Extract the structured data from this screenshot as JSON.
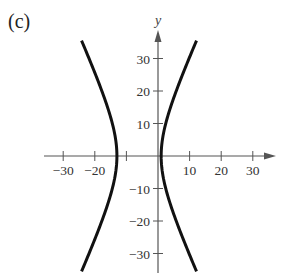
{
  "panel_label": "(c)",
  "chart_data": {
    "type": "line",
    "title": "",
    "xlabel": "x",
    "ylabel": "y",
    "xlim": [
      -35,
      38
    ],
    "ylim": [
      -36,
      40
    ],
    "grid": false,
    "legend": null,
    "x_ticks": [
      -30,
      -20,
      -10,
      10,
      20,
      30
    ],
    "x_tick_labels": [
      "−30",
      "−20",
      "10",
      "20",
      "30"
    ],
    "y_ticks": [
      30,
      20,
      10,
      -10,
      -20,
      -30
    ],
    "y_tick_labels": [
      "30",
      "20",
      "10",
      "−10",
      "−20",
      "−30"
    ],
    "curve_description": "Hyperbola opening left/right, center approx (-6, 0), vertices approx (-13, 0) and (1, 0)",
    "series": [
      {
        "name": "left branch",
        "points": [
          [
            -24,
            36
          ],
          [
            -20,
            27
          ],
          [
            -16,
            17
          ],
          [
            -14,
            9
          ],
          [
            -13,
            0
          ],
          [
            -14,
            -9
          ],
          [
            -16,
            -17
          ],
          [
            -20,
            -27
          ],
          [
            -25,
            -36
          ]
        ]
      },
      {
        "name": "right branch",
        "points": [
          [
            12,
            36
          ],
          [
            8,
            27
          ],
          [
            4,
            17
          ],
          [
            2,
            9
          ],
          [
            1,
            0
          ],
          [
            2,
            -9
          ],
          [
            4,
            -17
          ],
          [
            8,
            -27
          ],
          [
            13,
            -36
          ]
        ]
      }
    ]
  }
}
